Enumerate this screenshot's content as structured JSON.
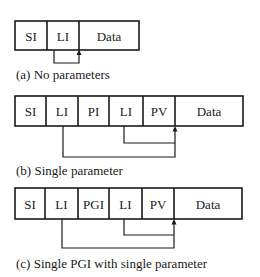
{
  "figure": {
    "panels": [
      {
        "id": "a",
        "caption": "(a) No parameters",
        "fields": [
          "SI",
          "LI",
          "Data"
        ],
        "pointers": [
          {
            "from_field": "LI",
            "to": "start-of-Data"
          }
        ]
      },
      {
        "id": "b",
        "caption": "(b) Single parameter",
        "fields": [
          "SI",
          "LI",
          "PI",
          "LI",
          "PV",
          "Data"
        ],
        "pointers": [
          {
            "from_field": "LI (1st)",
            "to": "start-of-Data"
          },
          {
            "from_field": "LI (2nd)",
            "to": "start-of-Data"
          }
        ]
      },
      {
        "id": "c",
        "caption": "(c) Single PGI with single parameter",
        "fields": [
          "SI",
          "LI",
          "PGI",
          "LI",
          "PV",
          "Data"
        ],
        "pointers": [
          {
            "from_field": "LI (1st)",
            "to": "start-of-Data"
          },
          {
            "from_field": "LI (2nd)",
            "to": "start-of-Data"
          }
        ]
      }
    ]
  },
  "colors": {
    "line": "#1a1a1a",
    "background": "#ffffff"
  }
}
